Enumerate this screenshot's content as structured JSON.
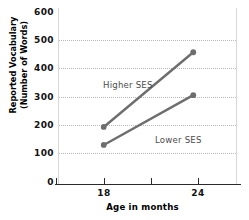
{
  "chart_data": {
    "type": "line",
    "title": "",
    "xlabel": "Age in months",
    "ylabel_line1": "Reported Vocabulary",
    "ylabel_line2": "(Number of Words)",
    "x": [
      18,
      24
    ],
    "xtick_labels": [
      "18",
      "24"
    ],
    "ytick_labels": [
      "600",
      "500",
      "400",
      "300",
      "200",
      "100",
      "0"
    ],
    "ytick_values": [
      600,
      500,
      400,
      300,
      200,
      100,
      0
    ],
    "ylim": [
      0,
      600
    ],
    "xlim": [
      15,
      27
    ],
    "grid": "horizontal-dotted",
    "legend": "inline-annotations",
    "series": [
      {
        "name": "Higher SES",
        "values": [
          170,
          440
        ],
        "color": "#6e6e6e",
        "marker": "circle"
      },
      {
        "name": "Lower SES",
        "values": [
          105,
          285
        ],
        "color": "#6e6e6e",
        "marker": "circle"
      }
    ],
    "annotations": [
      {
        "text": "Higher SES"
      },
      {
        "text": "Lower SES"
      }
    ]
  },
  "colors": {
    "series": "#6e6e6e",
    "grid": "#b9b9b9",
    "axis": "#2b2b2b",
    "text": "#111111",
    "annotation_text": "#4d4d4d",
    "background": "#ffffff"
  }
}
